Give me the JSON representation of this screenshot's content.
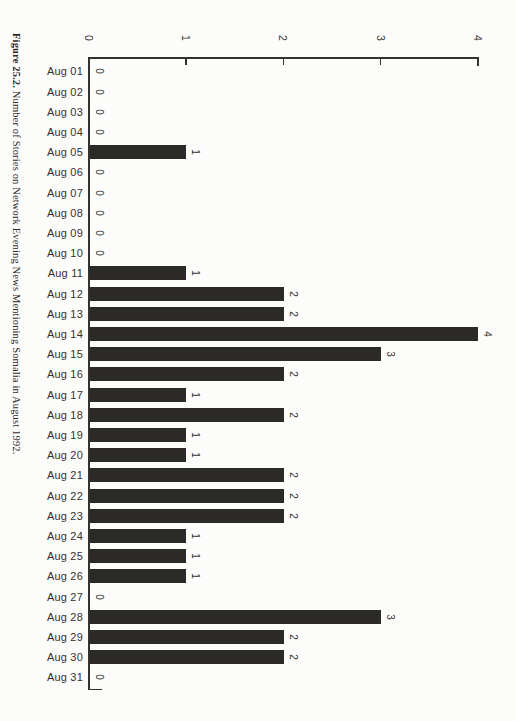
{
  "caption": {
    "figure_label": "Figure 25.2.",
    "text": " Number of Stories on Network Evening News Mentioning Somalia in August 1992."
  },
  "chart_data": {
    "type": "bar",
    "title": "Figure 25.2. Number of Stories on Network Evening News Mentioning Somalia in August 1992.",
    "orientation": "horizontal bars (figure printed rotated 90 degrees on the page)",
    "categories": [
      "Aug 01",
      "Aug 02",
      "Aug 03",
      "Aug 04",
      "Aug 05",
      "Aug 06",
      "Aug 07",
      "Aug 08",
      "Aug 09",
      "Aug 10",
      "Aug 11",
      "Aug 12",
      "Aug 13",
      "Aug 14",
      "Aug 15",
      "Aug 16",
      "Aug 17",
      "Aug 18",
      "Aug 19",
      "Aug 20",
      "Aug 21",
      "Aug 22",
      "Aug 23",
      "Aug 24",
      "Aug 25",
      "Aug 26",
      "Aug 27",
      "Aug 28",
      "Aug 29",
      "Aug 30",
      "Aug 31"
    ],
    "values": [
      0,
      0,
      0,
      0,
      1,
      0,
      0,
      0,
      0,
      0,
      1,
      2,
      2,
      4,
      3,
      2,
      1,
      2,
      1,
      1,
      2,
      2,
      2,
      1,
      1,
      1,
      0,
      3,
      2,
      2,
      0
    ],
    "value_axis_ticks": [
      0,
      1,
      2,
      3,
      4
    ],
    "value_axis_range": [
      0,
      4
    ],
    "value_labels_shown": true,
    "grid": false,
    "legend": false,
    "bar_color": "#2b2a28",
    "axis_color": "#343230",
    "background_color": "#fcfcfa"
  }
}
